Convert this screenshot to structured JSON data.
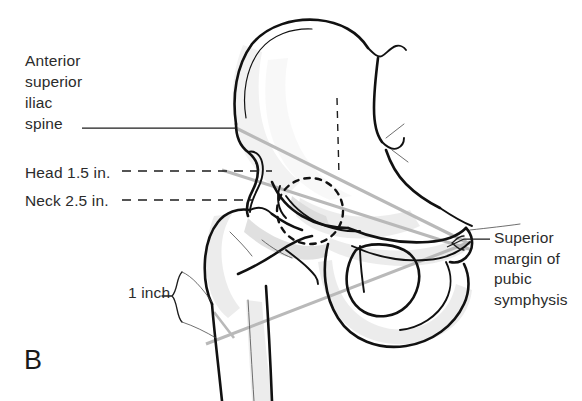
{
  "figure": {
    "panel_letter": "B"
  },
  "labels": {
    "asis": "Anterior\nsuperior\niliac\nspine",
    "head_measure": "Head 1.5 in.",
    "neck_measure": "Neck 2.5 in.",
    "one_inch": "1 inch",
    "pubic_symphysis": "Superior\nmargin of\npubic\nsymphysis"
  },
  "colors": {
    "outline": "#111111",
    "measure_line": "#b9b9b9",
    "shading": "#e9e9e9",
    "text": "#2b2b2b",
    "background": "#ffffff"
  }
}
